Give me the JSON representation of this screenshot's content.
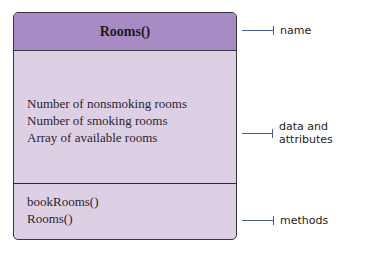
{
  "class_box": {
    "name": "Rooms()",
    "attributes": [
      "Number of nonsmoking rooms",
      "Number of smoking rooms",
      "Array of available rooms"
    ],
    "methods": [
      "bookRooms()",
      "Rooms()"
    ]
  },
  "labels": {
    "name": "name",
    "attributes": "data and attributes",
    "methods": "methods"
  },
  "colors": {
    "header": "#a88bc4",
    "body": "#ddd0e4",
    "border": "#3a3340",
    "pointer": "#4a5a9a"
  }
}
